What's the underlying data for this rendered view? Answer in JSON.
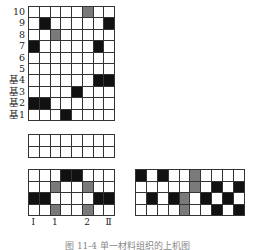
{
  "top_grid": {
    "rows": 10,
    "cols": 8,
    "row_labels": [
      "10",
      "9",
      "8",
      "7",
      "6",
      "5",
      "基4",
      "基3",
      "基2",
      "基1"
    ],
    "cells": [
      [
        "w",
        "w",
        "w",
        "w",
        "w",
        "g",
        "w",
        "w"
      ],
      [
        "w",
        "b",
        "w",
        "w",
        "w",
        "w",
        "w",
        "b"
      ],
      [
        "w",
        "w",
        "g",
        "w",
        "w",
        "w",
        "w",
        "w"
      ],
      [
        "b",
        "w",
        "w",
        "w",
        "w",
        "w",
        "b",
        "w"
      ],
      [
        "w",
        "w",
        "w",
        "w",
        "w",
        "w",
        "w",
        "w"
      ],
      [
        "w",
        "w",
        "w",
        "w",
        "w",
        "w",
        "w",
        "w"
      ],
      [
        "w",
        "w",
        "w",
        "w",
        "w",
        "w",
        "b",
        "b"
      ],
      [
        "w",
        "w",
        "w",
        "w",
        "b",
        "w",
        "w",
        "w"
      ],
      [
        "b",
        "b",
        "w",
        "w",
        "w",
        "w",
        "w",
        "w"
      ],
      [
        "w",
        "w",
        "w",
        "b",
        "w",
        "w",
        "w",
        "w"
      ]
    ]
  },
  "middle_grid": {
    "rows": 2,
    "cols": 8,
    "cells": [
      [
        "w",
        "w",
        "w",
        "w",
        "w",
        "w",
        "w",
        "w"
      ],
      [
        "w",
        "w",
        "w",
        "w",
        "w",
        "w",
        "w",
        "w"
      ]
    ]
  },
  "bottom_left_grid": {
    "rows": 4,
    "cols": 8,
    "cells": [
      [
        "w",
        "w",
        "w",
        "b",
        "b",
        "w",
        "w",
        "w"
      ],
      [
        "w",
        "w",
        "g",
        "w",
        "w",
        "g",
        "w",
        "w"
      ],
      [
        "b",
        "b",
        "w",
        "w",
        "w",
        "w",
        "b",
        "b"
      ],
      [
        "w",
        "w",
        "g",
        "w",
        "w",
        "g",
        "w",
        "w"
      ]
    ],
    "col_labels": [
      "Ⅰ",
      "",
      "1",
      "",
      "",
      "2",
      "",
      "Ⅱ"
    ]
  },
  "bottom_right_grid": {
    "rows": 4,
    "cols": 10,
    "cells": [
      [
        "b",
        "w",
        "b",
        "w",
        "w",
        "g",
        "w",
        "w",
        "w",
        "w"
      ],
      [
        "w",
        "w",
        "w",
        "w",
        "w",
        "g",
        "w",
        "b",
        "w",
        "b"
      ],
      [
        "w",
        "b",
        "w",
        "b",
        "g",
        "w",
        "b",
        "w",
        "b",
        "w"
      ],
      [
        "w",
        "w",
        "w",
        "w",
        "g",
        "w",
        "w",
        "b",
        "w",
        "b"
      ]
    ]
  },
  "caption": "图 11-4  单一材料组织的上机图",
  "colors": {
    "black": "#111111",
    "grey": "#7a7a7a",
    "white": "#ffffff",
    "line": "#333333"
  }
}
